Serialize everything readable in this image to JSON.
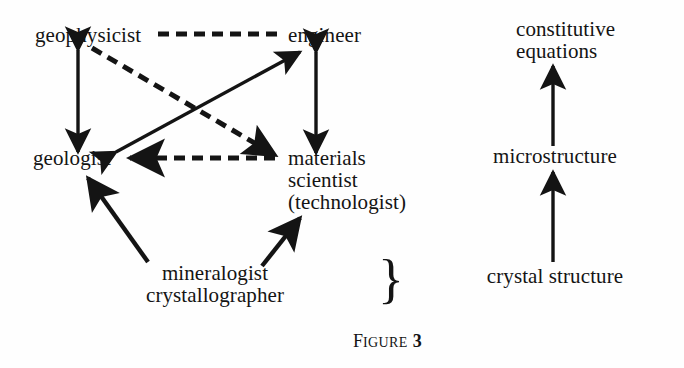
{
  "figure": {
    "caption_prefix": "F",
    "caption_word": "IGURE",
    "caption_number": "3",
    "brace_glyph": "}"
  },
  "diagram": {
    "disciplines": {
      "geophysicist": {
        "label": "geophysicist",
        "x": 35,
        "y": 42,
        "align": "left"
      },
      "engineer": {
        "label": "engineer",
        "x": 288,
        "y": 42,
        "align": "left"
      },
      "geologist": {
        "label": "geologist",
        "x": 33,
        "y": 165,
        "align": "left"
      },
      "materials_scientist": {
        "line1": "materials",
        "line2": "scientist",
        "line3": "(technologist)",
        "x": 288,
        "y": 165,
        "align": "left"
      },
      "mineralogist": {
        "line1": "mineralogist",
        "line2": "crystallographer",
        "x": 215,
        "y": 278,
        "align": "center"
      }
    },
    "scales": {
      "crystal_structure": {
        "label": "crystal structure",
        "x": 555,
        "y": 282,
        "align": "center"
      },
      "microstructure": {
        "label": "microstructure",
        "x": 555,
        "y": 162,
        "align": "center"
      },
      "constitutive_equations": {
        "line1": "constitutive",
        "line2": "equations",
        "x": 516,
        "y": 36,
        "align": "left"
      }
    },
    "connections": [
      {
        "name": "geophysicist-engineer",
        "style": "dashed",
        "heads": "none"
      },
      {
        "name": "geophysicist-geologist",
        "style": "solid",
        "heads": "both"
      },
      {
        "name": "engineer-materials-scientist",
        "style": "solid",
        "heads": "both"
      },
      {
        "name": "geologist-engineer",
        "style": "solid",
        "heads": "both"
      },
      {
        "name": "geophysicist-materials-scientist",
        "style": "dashed",
        "heads": "end"
      },
      {
        "name": "materials-scientist-geologist",
        "style": "dashed",
        "heads": "end"
      },
      {
        "name": "mineralogist-geologist",
        "style": "solid",
        "heads": "end"
      },
      {
        "name": "mineralogist-materials-scientist",
        "style": "solid",
        "heads": "end"
      },
      {
        "name": "crystal-structure-microstructure",
        "style": "solid",
        "heads": "end"
      },
      {
        "name": "microstructure-constitutive-equations",
        "style": "solid",
        "heads": "end"
      }
    ]
  },
  "colors": {
    "ink": "#141414",
    "paper": "#fefefe"
  }
}
